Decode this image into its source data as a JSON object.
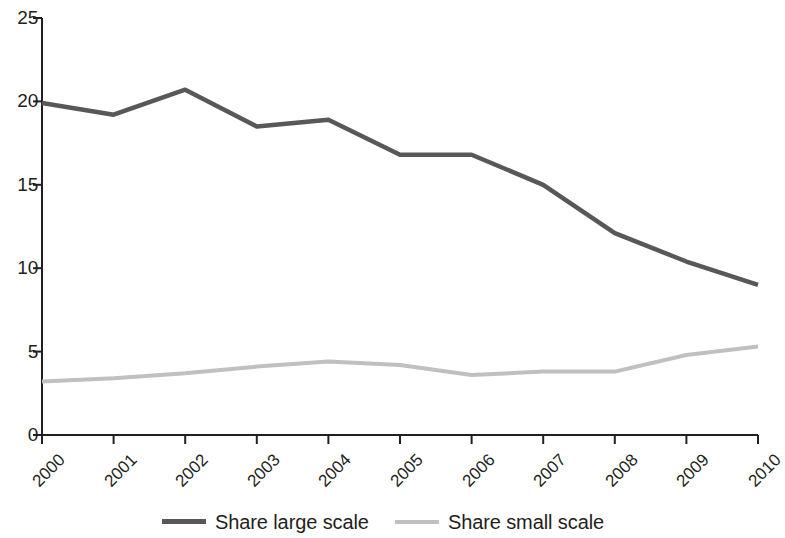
{
  "chart_data": {
    "type": "line",
    "title": "",
    "subtitle": "",
    "xlabel": "",
    "ylabel": "",
    "categories": [
      "2000",
      "2001",
      "2002",
      "2003",
      "2004",
      "2005",
      "2006",
      "2007",
      "2008",
      "2009",
      "2010"
    ],
    "x_tick_labels": [
      "2000",
      "2001",
      "2002",
      "2003",
      "2004",
      "2005",
      "2006",
      "2007",
      "2008",
      "2009",
      "2010"
    ],
    "x_tick_rotation": -45,
    "y_tick_labels": [
      "0",
      "5",
      "10",
      "15",
      "20",
      "25"
    ],
    "y_ticks": [
      0,
      5,
      10,
      15,
      20,
      25
    ],
    "ylim": [
      0,
      25
    ],
    "grid": false,
    "legend_position": "bottom",
    "series": [
      {
        "name": "Share large scale",
        "color": "#58585a",
        "values": [
          19.9,
          19.2,
          20.7,
          18.5,
          18.9,
          16.8,
          16.8,
          15.0,
          12.1,
          10.4,
          9.0
        ]
      },
      {
        "name": "Share small scale",
        "color": "#c0c0c2",
        "values": [
          3.2,
          3.4,
          3.7,
          4.1,
          4.4,
          4.2,
          3.6,
          3.8,
          3.8,
          4.8,
          5.3
        ]
      }
    ]
  },
  "legend": {
    "items": [
      {
        "label": "Share large scale",
        "color": "#58585a"
      },
      {
        "label": "Share small scale",
        "color": "#c0c0c2"
      }
    ]
  },
  "axes": {
    "axis_color": "#231f20"
  }
}
